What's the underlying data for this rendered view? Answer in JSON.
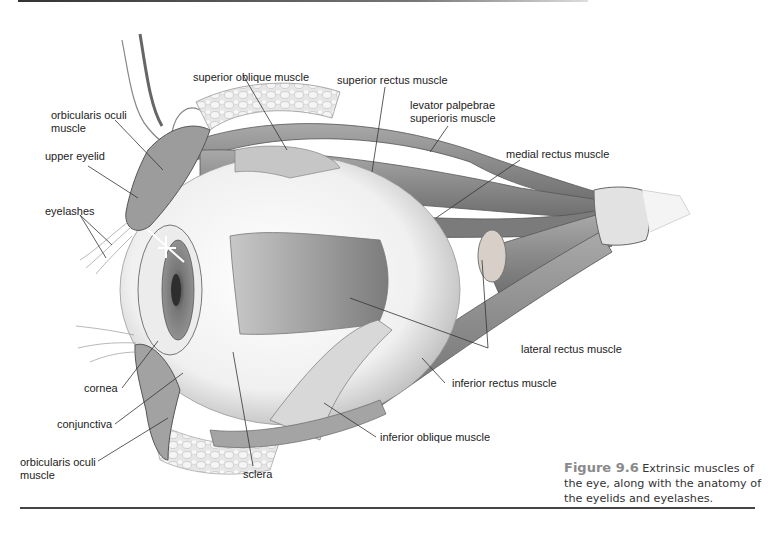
{
  "figure": {
    "number": "Figure 9.6",
    "caption": "Extrinsic muscles of the eye, along with the anatomy of the eyelids and eyelashes."
  },
  "labels": {
    "superior_oblique": "superior oblique muscle",
    "superior_rectus": "superior rectus muscle",
    "levator_line1": "levator palpebrae",
    "levator_line2": "superioris muscle",
    "medial_rectus": "medial rectus muscle",
    "orbicularis_top_line1": "orbicularis oculi",
    "orbicularis_top_line2": "muscle",
    "upper_eyelid": "upper eyelid",
    "eyelashes": "eyelashes",
    "lateral_rectus": "lateral rectus muscle",
    "inferior_rectus": "inferior rectus muscle",
    "cornea": "cornea",
    "conjunctiva": "conjunctiva",
    "inferior_oblique": "inferior oblique muscle",
    "orbicularis_bottom_line1": "orbicularis oculi",
    "orbicularis_bottom_line2": "muscle",
    "sclera": "sclera"
  },
  "colors": {
    "ink": "#222222",
    "caption_fig": "#8a8a8a",
    "muscle": "#8f8f8f",
    "muscle_dark": "#6b6b6b",
    "tendon": "#e2e2e2"
  }
}
